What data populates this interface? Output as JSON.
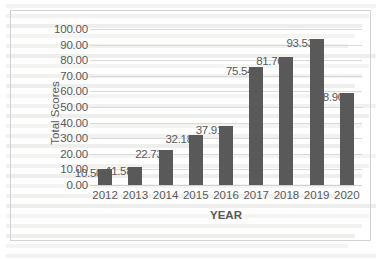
{
  "chart_data": {
    "type": "bar",
    "title": "",
    "xlabel": "YEAR",
    "ylabel": "Total Scores",
    "categories": [
      "2012",
      "2013",
      "2014",
      "2015",
      "2016",
      "2017",
      "2018",
      "2019",
      "2020"
    ],
    "values": [
      10.5,
      11.58,
      22.73,
      32.18,
      37.91,
      75.54,
      81.76,
      93.53,
      58.9
    ],
    "data_labels": [
      "10.50",
      "11.58",
      "22.73",
      "32.18",
      "37.91",
      "75.54",
      "81.76",
      "93.53",
      "58.90"
    ],
    "ylim": [
      0,
      100
    ],
    "ytick_labels": [
      "0.00",
      "10.00",
      "20.00",
      "30.00",
      "40.00",
      "50.00",
      "60.00",
      "70.00",
      "80.00",
      "90.00",
      "100.00"
    ],
    "ytick_values": [
      0,
      10,
      20,
      30,
      40,
      50,
      60,
      70,
      80,
      90,
      100
    ],
    "grid": true,
    "legend": false,
    "series_color": "#595959",
    "gridline_color": "#d9d9d9",
    "text_color": "#595959",
    "border_color": "#d2d2d2"
  }
}
